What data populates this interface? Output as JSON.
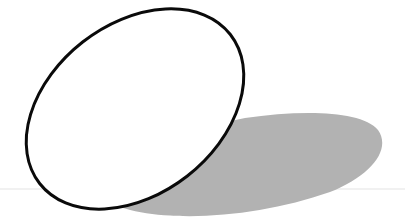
{
  "illustration": {
    "subject": "egg-with-shadow",
    "background_color": "#ffffff",
    "outline_color": "#0a0a0a",
    "shadow_color": "#b2b2b2",
    "ground_line_color": "#ececec",
    "egg": {
      "center_x": 135,
      "center_y": 108,
      "radius_x": 120,
      "radius_y": 86,
      "rotation_deg": -38,
      "stroke_width": 3
    },
    "shadow": {
      "center_x": 245,
      "center_y": 163,
      "radius_x": 142,
      "radius_y": 44,
      "rotation_deg": -13
    },
    "ground_line_y": 189
  }
}
